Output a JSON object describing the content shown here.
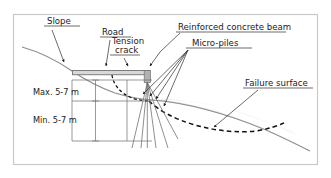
{
  "figure": {
    "type": "engineering-cross-section",
    "title_present": false,
    "background_color": "#ffffff",
    "frame_color": "#c9c9c9"
  },
  "labels": {
    "slope": "Slope",
    "road": "Road",
    "tension_line1": "Tension",
    "tension_line2": "crack",
    "beam": "Reinforced concrete beam",
    "micro_piles": "Micro-piles",
    "failure_surface": "Failure surface",
    "dim_max": "Max. 5-7 m",
    "dim_min": "Min. 5-7 m"
  },
  "dimensions": [
    {
      "name": "upper-embedment",
      "label": "Max. 5-7 m",
      "value_min": 5,
      "value_max": 7,
      "unit": "m"
    },
    {
      "name": "lower-embedment",
      "label": "Min. 5-7 m",
      "value_min": 5,
      "value_max": 7,
      "unit": "m"
    }
  ],
  "elements": [
    {
      "name": "slope-ground-line",
      "style": "solid-gray"
    },
    {
      "name": "road-surface",
      "style": "filled-band"
    },
    {
      "name": "reinforced-concrete-beam",
      "style": "filled-gray-block"
    },
    {
      "name": "tension-crack",
      "style": "dashed-curve"
    },
    {
      "name": "failure-surface",
      "style": "dashed-heavy-curve"
    },
    {
      "name": "micro-piles",
      "style": "thin-inclined-lines",
      "count": 6
    },
    {
      "name": "sliding-mass",
      "style": "light-gray-fill"
    }
  ],
  "colors": {
    "ground_line": "#8c8c8c",
    "failure_surface": "#111111",
    "tension_crack": "#111111",
    "beam_fill": "#b2b2b2",
    "road_fill": "#d8d8d8",
    "sliding_mass_fill": "#e2e2e2",
    "text": "#1a1a1a",
    "leader": "#2b2b2b"
  }
}
